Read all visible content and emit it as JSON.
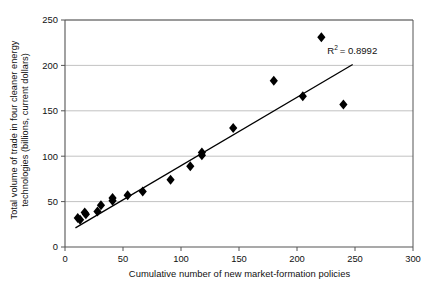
{
  "chart_data": {
    "type": "scatter",
    "title": "",
    "xlabel": "Cumulative number of new market-formation policies",
    "ylabel": "Total volume of trade in four cleaner energy technologies (billions, current dollars)",
    "ylabel_line1": "Total volume of trade in four cleaner energy",
    "ylabel_line2": "technologies (billions, current dollars)",
    "xlim": [
      0,
      300
    ],
    "ylim": [
      0,
      250
    ],
    "xticks": [
      0,
      50,
      100,
      150,
      200,
      250,
      300
    ],
    "xtick_labels": [
      "0",
      "50",
      "100",
      "150",
      "200",
      "250",
      "300"
    ],
    "yticks": [
      0,
      50,
      100,
      150,
      200,
      250
    ],
    "ytick_labels": [
      "0",
      "50",
      "100",
      "150",
      "200",
      "250"
    ],
    "grid": "horizontal",
    "grid_color": "#b3b3b3",
    "axis_color": "#555555",
    "marker": "diamond",
    "marker_color": "#000000",
    "marker_size": 5,
    "points": [
      {
        "x": 11,
        "y": 32
      },
      {
        "x": 13,
        "y": 30
      },
      {
        "x": 17,
        "y": 38
      },
      {
        "x": 18,
        "y": 36
      },
      {
        "x": 28,
        "y": 39
      },
      {
        "x": 31,
        "y": 46
      },
      {
        "x": 41,
        "y": 54
      },
      {
        "x": 41,
        "y": 51
      },
      {
        "x": 54,
        "y": 57
      },
      {
        "x": 67,
        "y": 61
      },
      {
        "x": 91,
        "y": 74
      },
      {
        "x": 108,
        "y": 89
      },
      {
        "x": 118,
        "y": 104
      },
      {
        "x": 118,
        "y": 101
      },
      {
        "x": 145,
        "y": 131
      },
      {
        "x": 180,
        "y": 183
      },
      {
        "x": 205,
        "y": 166
      },
      {
        "x": 221,
        "y": 231
      },
      {
        "x": 240,
        "y": 157
      }
    ],
    "trendline": {
      "x_start": 9,
      "y_start": 21,
      "x_end": 248,
      "y_end": 201,
      "color": "#000000",
      "width": 1.3
    },
    "annotation": {
      "text": "R2 = 0.8992",
      "r_symbol": "R",
      "exponent": "2",
      "equals_value": "= 0.8992",
      "x": 226,
      "y": 213
    }
  }
}
